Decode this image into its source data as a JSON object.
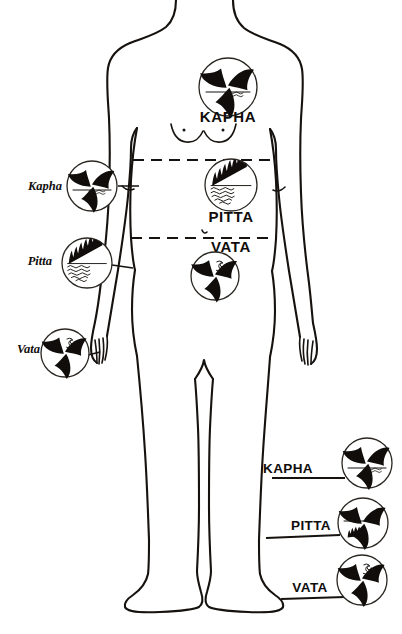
{
  "diagram": {
    "background_color": "#ffffff",
    "ink_color": "#15120f",
    "figure": {
      "name": "human-body-outline",
      "view": "anterior full body, head cropped at top edge",
      "regions": [
        {
          "key": "kapha",
          "zone": "chest / thorax",
          "label": "KAPHA"
        },
        {
          "key": "pitta",
          "zone": "abdomen / navel",
          "label": "PITTA"
        },
        {
          "key": "vata",
          "zone": "pelvis / lower abdomen",
          "label": "VATA"
        }
      ],
      "divider_lines": 2
    },
    "center_labels": [
      {
        "name": "center-label-kapha",
        "text": "KAPHA"
      },
      {
        "name": "center-label-pitta",
        "text": "PITTA"
      },
      {
        "name": "center-label-vata",
        "text": "VATA"
      }
    ],
    "left_labels": [
      {
        "name": "left-label-kapha",
        "text": "Kapha",
        "symbol": "triskelion-water"
      },
      {
        "name": "left-label-pitta",
        "text": "Pitta",
        "symbol": "flame-over-water"
      },
      {
        "name": "left-label-vata",
        "text": "Vata",
        "symbol": "triskelion-spiral"
      }
    ],
    "right_labels": [
      {
        "name": "right-label-kapha",
        "text": "KAPHA",
        "symbol": "triskelion-water"
      },
      {
        "name": "right-label-pitta",
        "text": "PITTA",
        "symbol": "triskelion-flame"
      },
      {
        "name": "right-label-vata",
        "text": "VATA",
        "symbol": "triskelion-spiral"
      }
    ],
    "symbols": [
      {
        "name": "symbol-kapha-chest",
        "glyph": "triskelion-water",
        "placement": "chest center"
      },
      {
        "name": "symbol-pitta-abdomen",
        "glyph": "flame-over-water",
        "placement": "abdomen center"
      },
      {
        "name": "symbol-vata-pelvis",
        "glyph": "triskelion-spiral",
        "placement": "pelvis center"
      },
      {
        "name": "symbol-kapha-left",
        "glyph": "triskelion-water",
        "placement": "left margin upper"
      },
      {
        "name": "symbol-pitta-left",
        "glyph": "flame-over-water",
        "placement": "left margin middle"
      },
      {
        "name": "symbol-vata-left",
        "glyph": "triskelion-spiral",
        "placement": "left margin lower, at hand"
      },
      {
        "name": "symbol-kapha-right",
        "glyph": "triskelion-water",
        "placement": "right margin upper"
      },
      {
        "name": "symbol-pitta-right",
        "glyph": "triskelion-flame",
        "placement": "right margin middle"
      },
      {
        "name": "symbol-vata-right",
        "glyph": "triskelion-spiral",
        "placement": "right margin lower"
      }
    ]
  }
}
